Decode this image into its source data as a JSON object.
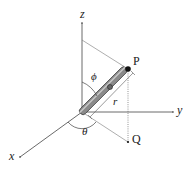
{
  "diagram": {
    "type": "spherical-coordinates",
    "labels": {
      "z_axis": "z",
      "y_axis": "y",
      "x_axis": "x",
      "point_p": "P",
      "point_q": "Q",
      "radius": "r",
      "polar_angle": "ϕ",
      "azimuth_angle": "θ"
    },
    "colors": {
      "axis": "#444444",
      "rod_fill": "#8a8a8a",
      "rod_outline": "#333333",
      "point": "#111111"
    }
  }
}
